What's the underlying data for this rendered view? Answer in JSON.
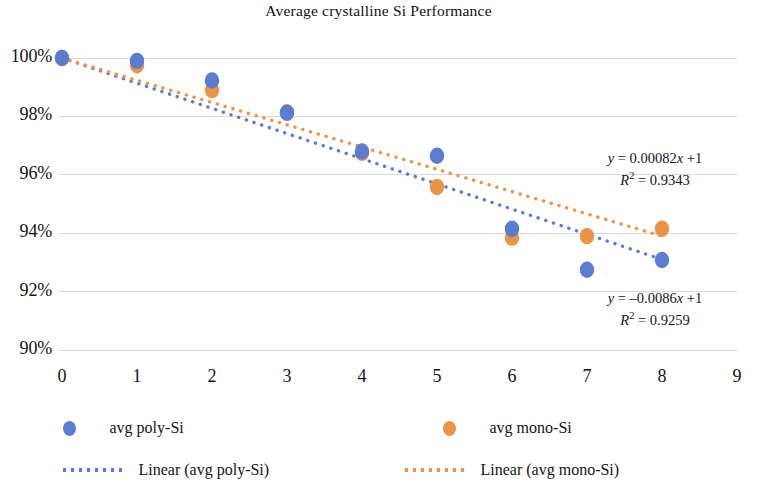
{
  "chart_data": {
    "type": "scatter",
    "title": "Average crystalline Si Performance",
    "xlabel": "",
    "ylabel": "",
    "xlim": [
      0,
      9
    ],
    "ylim": [
      0.9,
      1.0
    ],
    "grid": true,
    "legend_position": "bottom",
    "x_ticks": [
      "0",
      "1",
      "2",
      "3",
      "4",
      "5",
      "6",
      "7",
      "8",
      "9"
    ],
    "x_tick_values": [
      0,
      1,
      2,
      3,
      4,
      5,
      6,
      7,
      8,
      9
    ],
    "y_ticks": [
      "90%",
      "92%",
      "94%",
      "96%",
      "98%",
      "100%"
    ],
    "y_tick_values": [
      0.9,
      0.92,
      0.94,
      0.96,
      0.98,
      1.0
    ],
    "x": [
      0,
      1,
      2,
      3,
      4,
      5,
      6,
      7,
      8
    ],
    "series": [
      {
        "name": "avg poly-Si",
        "color": "#5b7dd1",
        "marker": "circle",
        "values": [
          1.0,
          0.999,
          0.9923,
          0.9812,
          0.968,
          0.9665,
          0.9415,
          0.9275,
          0.9308
        ]
      },
      {
        "name": "avg mono-Si",
        "color": "#ed9344",
        "marker": "circle",
        "values": [
          1.0,
          0.9975,
          0.989,
          0.9814,
          0.9675,
          0.9558,
          0.9385,
          0.939,
          0.9415
        ]
      }
    ],
    "trendlines": [
      {
        "name": "Linear (avg poly-Si)",
        "color": "#5b7dd1",
        "style": "dotted",
        "x_start": 0,
        "x_end": 8,
        "y_start": 1.0,
        "y_end": 0.931
      },
      {
        "name": "Linear (avg mono-Si)",
        "color": "#ed9344",
        "style": "dotted",
        "x_start": 0,
        "x_end": 8,
        "y_start": 1.0,
        "y_end": 0.939
      }
    ],
    "annotations": [
      {
        "id": "mono-fit",
        "equation_prefix": "y",
        "equation_body": " = 0.00082",
        "equation_var": "x",
        "equation_suffix": " +1",
        "r2_label": "R",
        "r2_exp": "2",
        "r2_value": " = 0.9343"
      },
      {
        "id": "poly-fit",
        "equation_prefix": "y",
        "equation_body": " = –0.0086",
        "equation_var": "x",
        "equation_suffix": " +1",
        "r2_label": "R",
        "r2_exp": "2",
        "r2_value": " = 0.9259"
      }
    ],
    "legend": [
      {
        "label": "avg poly-Si",
        "kind": "marker",
        "color": "#5b7dd1"
      },
      {
        "label": "avg mono-Si",
        "kind": "marker",
        "color": "#ed9344"
      },
      {
        "label": "Linear (avg poly-Si)",
        "kind": "dotted-line",
        "color": "#5b7dd1"
      },
      {
        "label": "Linear (avg mono-Si)",
        "kind": "dotted-line",
        "color": "#ed9344"
      }
    ]
  }
}
